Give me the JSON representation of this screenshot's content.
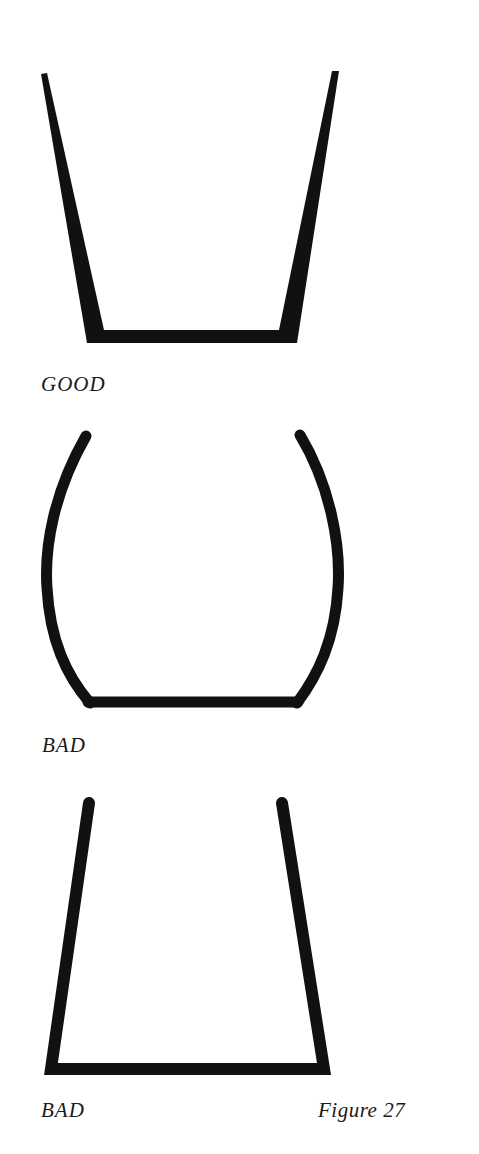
{
  "figure": {
    "caption": "Figure 27",
    "panels": [
      {
        "id": "good",
        "label": "GOOD",
        "shape": "tapered straight walls, thickening toward base"
      },
      {
        "id": "bad-curved",
        "label": "BAD",
        "shape": "bulging curved walls"
      },
      {
        "id": "bad-uniform",
        "label": "BAD",
        "shape": "straight walls of uniform thickness"
      }
    ]
  },
  "colors": {
    "ink": "#111111",
    "paper": "#ffffff"
  }
}
